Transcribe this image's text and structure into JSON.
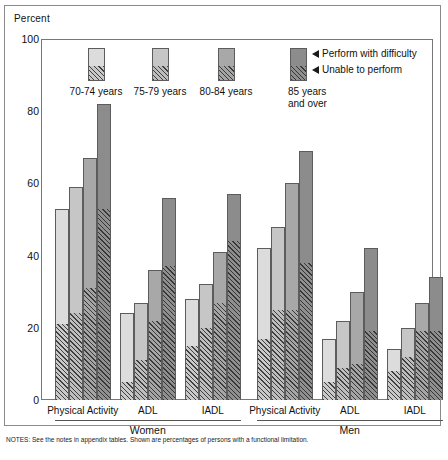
{
  "chart_data": {
    "type": "bar",
    "title": "",
    "ylabel": "Percent",
    "xlabel": "",
    "ylim": [
      0,
      100
    ],
    "yticks": [
      0,
      20,
      40,
      60,
      80,
      100
    ],
    "grid": false,
    "legend_position": "top-right",
    "stacked": true,
    "stack_segments": [
      "Perform with difficulty",
      "Unable to perform"
    ],
    "series": [
      {
        "name": "70-74 years",
        "swatch_top": "#dcdcdc",
        "swatch_bottom": "#c9c9c9"
      },
      {
        "name": "75-79 years",
        "swatch_top": "#c6c6c6",
        "swatch_bottom": "#bdbdbd"
      },
      {
        "name": "80-84 years",
        "swatch_top": "#a8a8a8",
        "swatch_bottom": "#a5a5a5"
      },
      {
        "name": "85 years and over",
        "swatch_top": "#8c8c8c",
        "swatch_bottom": "#8f8f8f"
      }
    ],
    "groups": [
      {
        "sex": "Women",
        "categories": [
          {
            "label": "Physical Activity",
            "bars": [
              {
                "age": "70-74 years",
                "total": 53,
                "unable": 21
              },
              {
                "age": "75-79 years",
                "total": 59,
                "unable": 24
              },
              {
                "age": "80-84 years",
                "total": 67,
                "unable": 31
              },
              {
                "age": "85 years and over",
                "total": 82,
                "unable": 53
              }
            ]
          },
          {
            "label": "ADL",
            "bars": [
              {
                "age": "70-74 years",
                "total": 24,
                "unable": 5
              },
              {
                "age": "75-79 years",
                "total": 27,
                "unable": 11
              },
              {
                "age": "80-84 years",
                "total": 36,
                "unable": 22
              },
              {
                "age": "85 years and over",
                "total": 56,
                "unable": 37
              }
            ]
          },
          {
            "label": "IADL",
            "bars": [
              {
                "age": "70-74 years",
                "total": 28,
                "unable": 15
              },
              {
                "age": "75-79 years",
                "total": 32,
                "unable": 20
              },
              {
                "age": "80-84 years",
                "total": 41,
                "unable": 27
              },
              {
                "age": "85 years and over",
                "total": 57,
                "unable": 44
              }
            ]
          }
        ]
      },
      {
        "sex": "Men",
        "categories": [
          {
            "label": "Physical Activity",
            "bars": [
              {
                "age": "70-74 years",
                "total": 42,
                "unable": 17
              },
              {
                "age": "75-79 years",
                "total": 48,
                "unable": 25
              },
              {
                "age": "80-84 years",
                "total": 60,
                "unable": 25
              },
              {
                "age": "85 years and over",
                "total": 69,
                "unable": 38
              }
            ]
          },
          {
            "label": "ADL",
            "bars": [
              {
                "age": "70-74 years",
                "total": 17,
                "unable": 5
              },
              {
                "age": "75-79 years",
                "total": 22,
                "unable": 9
              },
              {
                "age": "80-84 years",
                "total": 30,
                "unable": 10
              },
              {
                "age": "85 years and over",
                "total": 42,
                "unable": 19
              }
            ]
          },
          {
            "label": "IADL",
            "bars": [
              {
                "age": "70-74 years",
                "total": 14,
                "unable": 8
              },
              {
                "age": "75-79 years",
                "total": 20,
                "unable": 12
              },
              {
                "age": "80-84 years",
                "total": 27,
                "unable": 19
              },
              {
                "age": "85 years and over",
                "total": 34,
                "unable": 19
              }
            ]
          }
        ]
      }
    ]
  },
  "legend": {
    "items": [
      {
        "label": "70-74 years"
      },
      {
        "label": "75-79 years"
      },
      {
        "label": "80-84 years"
      },
      {
        "label_line1": "85 years",
        "label_line2": "and over"
      }
    ],
    "keys": [
      {
        "label": "Perform with difficulty"
      },
      {
        "label": "Unable to perform"
      }
    ]
  },
  "axis": {
    "ylabel": "Percent",
    "ticks": [
      "100",
      "80",
      "60",
      "40",
      "20",
      "0"
    ]
  },
  "footer": {
    "text": "NOTES: See the notes in appendix tables. Shown are percentages of persons with a functional limitation."
  }
}
